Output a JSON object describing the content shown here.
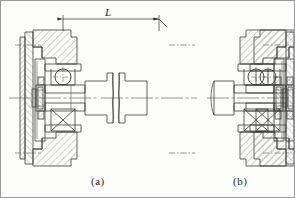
{
  "figure": {
    "type": "engineering-cross-section-drawing",
    "background_color": "#fdfdfb",
    "line_color": "#3a3a3a",
    "hatch_color": "#7d7d7d",
    "centerline_color": "#6b6b6b",
    "border_color": "#9a9a9a"
  },
  "dimensions": {
    "span_label": "L",
    "span_label_style": "italic",
    "arrow_left_x": 62,
    "arrow_right_x": 158,
    "dim_line_y": 18
  },
  "captions": {
    "left": "(a)",
    "right": "(b)"
  },
  "views": [
    {
      "id": "view-a",
      "caption": "(a)",
      "description": "two bearing housings straddling a stepped shaft with break line",
      "components": [
        "housing-left",
        "end-cap-left",
        "ball-bearing-upper-left",
        "roller-bearing-lower-left",
        "shaft",
        "shaft-break",
        "housing-right",
        "end-cap-right",
        "ball-bearing-upper-right",
        "roller-bearing-lower-right"
      ]
    },
    {
      "id": "view-b",
      "caption": "(b)",
      "description": "single bearing housing with short cantilever shaft end",
      "components": [
        "housing",
        "end-cap",
        "ball-bearing-upper",
        "roller-bearing-lower",
        "shaft-stub"
      ]
    }
  ],
  "axes": {
    "main_centerline_y": 97,
    "bolt_centerline_upper_y": 44,
    "bolt_centerline_lower_y": 152
  }
}
